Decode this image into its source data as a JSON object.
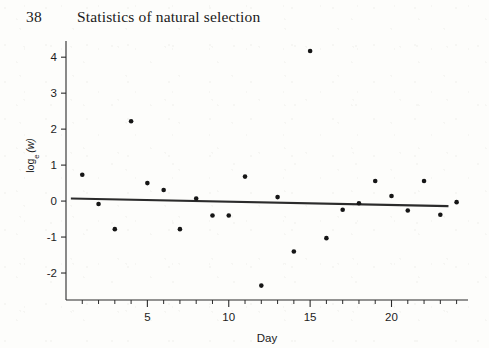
{
  "page": {
    "folio": "38",
    "running_title": "Statistics of natural selection"
  },
  "chart_data": {
    "type": "scatter",
    "title": "",
    "xlabel": "Day",
    "ylabel": "log_e (w)",
    "ylabel_parts": {
      "base": "log",
      "subscript": "e",
      "variable": "(w)"
    },
    "xlim": [
      0,
      24.7
    ],
    "ylim": [
      -2.75,
      4.45
    ],
    "xticks_major": [
      5,
      10,
      15,
      20
    ],
    "xticklabels_major": [
      "5",
      "10",
      "15",
      "20"
    ],
    "xticks_minor": [
      1,
      2,
      3,
      4,
      6,
      7,
      8,
      9,
      11,
      12,
      13,
      14,
      16,
      17,
      18,
      19,
      21,
      22,
      23,
      24
    ],
    "yticks": [
      4,
      3,
      2,
      1,
      0,
      -1,
      -2
    ],
    "yticklabels": [
      "4",
      "3",
      "2",
      "1",
      "0",
      "-1",
      "-2"
    ],
    "grid": false,
    "legend": false,
    "marker": {
      "shape": "circle",
      "size_px": 4.6,
      "color": "#161616"
    },
    "x": [
      1,
      2,
      3,
      4,
      5,
      6,
      7,
      8,
      9,
      10,
      11,
      12,
      13,
      14,
      15,
      16,
      17,
      18,
      19,
      20,
      21,
      22,
      23,
      24
    ],
    "y": [
      0.73,
      -0.08,
      -0.78,
      2.22,
      0.5,
      0.31,
      -0.78,
      0.07,
      -0.4,
      -0.4,
      0.68,
      -2.35,
      0.11,
      -1.4,
      4.17,
      -1.03,
      -0.24,
      -0.06,
      0.56,
      0.14,
      -0.26,
      0.56,
      -0.38,
      -0.03
    ],
    "points": [
      {
        "day": 1,
        "value": 0.73
      },
      {
        "day": 2,
        "value": -0.08
      },
      {
        "day": 3,
        "value": -0.78
      },
      {
        "day": 4,
        "value": 2.22
      },
      {
        "day": 5,
        "value": 0.5
      },
      {
        "day": 6,
        "value": 0.31
      },
      {
        "day": 7,
        "value": -0.78
      },
      {
        "day": 8,
        "value": 0.07
      },
      {
        "day": 9,
        "value": -0.4
      },
      {
        "day": 10,
        "value": -0.4
      },
      {
        "day": 11,
        "value": 0.68
      },
      {
        "day": 12,
        "value": -2.35
      },
      {
        "day": 13,
        "value": 0.11
      },
      {
        "day": 14,
        "value": -1.4
      },
      {
        "day": 15,
        "value": 4.17
      },
      {
        "day": 16,
        "value": -1.03
      },
      {
        "day": 17,
        "value": -0.24
      },
      {
        "day": 18,
        "value": -0.06
      },
      {
        "day": 19,
        "value": 0.56
      },
      {
        "day": 20,
        "value": 0.14
      },
      {
        "day": 21,
        "value": -0.26
      },
      {
        "day": 22,
        "value": 0.56
      },
      {
        "day": 23,
        "value": -0.38
      },
      {
        "day": 24,
        "value": -0.03
      }
    ],
    "fit_line": {
      "type": "linear-regression",
      "x_start": 0.3,
      "y_start": 0.07,
      "x_end": 23.5,
      "y_end": -0.14,
      "color": "#2b2b2b",
      "width_px": 2.1
    }
  }
}
